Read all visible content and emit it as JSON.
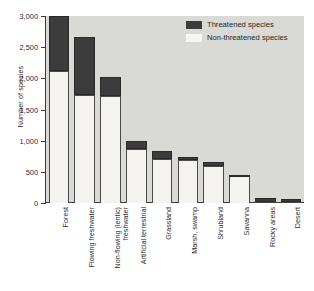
{
  "chart_data": {
    "type": "bar",
    "subtype": "stacked-bar",
    "title": "",
    "xlabel": "",
    "ylabel": "Number of species",
    "ylim": [
      0,
      3000
    ],
    "yticks": [
      0,
      500,
      1000,
      1500,
      2000,
      2500,
      3000
    ],
    "ytick_labels": [
      "0",
      "500",
      "1,000",
      "1,500",
      "2,000",
      "2,500",
      "3,000"
    ],
    "grid": false,
    "legend_position": "top-right",
    "categories": [
      "Forest",
      "Flowing freshwater",
      "Non-flowing (lentic)\nfreshwater",
      "Artificial terrestrial",
      "Grassland",
      "Marsh, swamp",
      "Shrubland",
      "Savanna",
      "Rocky areas",
      "Desert"
    ],
    "series": [
      {
        "name": "Non-threatened species",
        "color": "#f4f3ef",
        "values": [
          2110,
          1740,
          1720,
          870,
          710,
          690,
          600,
          440,
          20,
          20
        ]
      },
      {
        "name": "Threatened species",
        "color": "#3c3c3c",
        "values": [
          890,
          920,
          300,
          120,
          120,
          40,
          60,
          10,
          65,
          45
        ]
      }
    ],
    "totals": [
      3000,
      2660,
      2020,
      990,
      830,
      730,
      660,
      450,
      85,
      65
    ]
  },
  "legend": {
    "items": [
      {
        "label": "Threatened species",
        "swatch": "threat"
      },
      {
        "label": "Non-threatened species",
        "swatch": "nonthreat"
      }
    ]
  },
  "colors": {
    "plot_background": "#d9d9d6",
    "threatened": "#3c3c3c",
    "non_threatened": "#f4f3ef",
    "axis": "#3a3a3a",
    "text": "#2b2b2b"
  }
}
